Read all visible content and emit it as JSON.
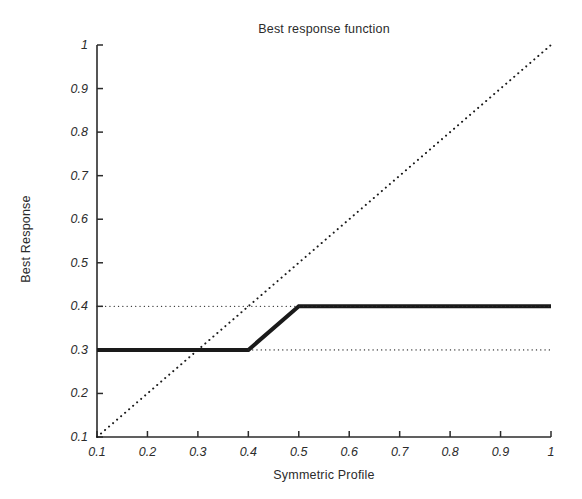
{
  "chart_data": {
    "type": "line",
    "title": "Best response function",
    "xlabel": "Symmetric Profile",
    "ylabel": "Best Response",
    "xlim": [
      0.1,
      1
    ],
    "ylim": [
      0.1,
      1
    ],
    "xticks": [
      "0.1",
      "0.2",
      "0.3",
      "0.4",
      "0.5",
      "0.6",
      "0.7",
      "0.8",
      "0.9",
      "1"
    ],
    "yticks": [
      "0.1",
      "0.2",
      "0.3",
      "0.4",
      "0.5",
      "0.6",
      "0.7",
      "0.8",
      "0.9",
      "1"
    ],
    "xtick_values": [
      0.1,
      0.2,
      0.3,
      0.4,
      0.5,
      0.6,
      0.7,
      0.8,
      0.9,
      1.0
    ],
    "ytick_values": [
      0.1,
      0.2,
      0.3,
      0.4,
      0.5,
      0.6,
      0.7,
      0.8,
      0.9,
      1.0
    ],
    "grid": false,
    "legend": null,
    "series": [
      {
        "name": "Best response",
        "style": "solid",
        "linewidth": 4,
        "color": "#1a1a1a",
        "x": [
          0.1,
          0.4,
          0.5,
          1.0
        ],
        "y": [
          0.3,
          0.3,
          0.4,
          0.4
        ]
      },
      {
        "name": "45-degree identity line",
        "style": "dotted",
        "linewidth": 2,
        "color": "#1a1a1a",
        "x": [
          0.1,
          1.0
        ],
        "y": [
          0.1,
          1.0
        ]
      },
      {
        "name": "reference line y=0.4",
        "style": "dotted",
        "linewidth": 1.3,
        "color": "#2b2b2b",
        "x": [
          0.1,
          1.0
        ],
        "y": [
          0.4,
          0.4
        ]
      },
      {
        "name": "reference line y=0.3",
        "style": "dotted",
        "linewidth": 1.3,
        "color": "#2b2b2b",
        "x": [
          0.4,
          1.0
        ],
        "y": [
          0.3,
          0.3
        ]
      }
    ],
    "annotations": [
      {
        "label": "fixed point at intersection of best response and identity line",
        "x": 0.3,
        "y": 0.3
      }
    ]
  },
  "axes": {
    "plot_left_px": 97,
    "plot_right_px": 551,
    "plot_top_px": 45,
    "plot_bottom_px": 437
  }
}
